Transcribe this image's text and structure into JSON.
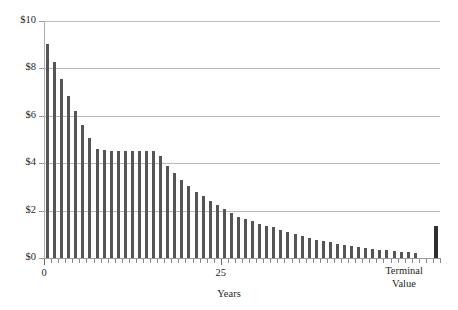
{
  "chart_data": {
    "type": "bar",
    "title": "",
    "subtitle": "",
    "xlabel": "Years",
    "ylabel": "",
    "ylim": [
      0,
      10
    ],
    "xlim": [
      0,
      54
    ],
    "grid": true,
    "legend": null,
    "y_tick_labels": [
      "$10",
      "$8",
      "$6",
      "$4",
      "$2",
      "$0"
    ],
    "y_tick_values": [
      10,
      8,
      6,
      4,
      2,
      0
    ],
    "x_tick_labels": [
      "0",
      "25"
    ],
    "x_tick_values": [
      0,
      25
    ],
    "annotations": [
      "Terminal Value"
    ],
    "terminal_value_label_lines": [
      "Terminal",
      "Value"
    ],
    "bar_color": "#555555",
    "terminal_bar_color": "#2f2f2f",
    "gridline_color": "#b9b9b9",
    "axis_color": "#9a9a9a",
    "categories": [
      1,
      2,
      3,
      4,
      5,
      6,
      7,
      8,
      9,
      10,
      11,
      12,
      13,
      14,
      15,
      16,
      17,
      18,
      19,
      20,
      21,
      22,
      23,
      24,
      25,
      26,
      27,
      28,
      29,
      30,
      31,
      32,
      33,
      34,
      35,
      36,
      37,
      38,
      39,
      40,
      41,
      42,
      43,
      44,
      45,
      46,
      47,
      48,
      49,
      50,
      51,
      52,
      53
    ],
    "values": [
      9.05,
      8.25,
      7.55,
      6.85,
      6.2,
      5.6,
      5.05,
      4.6,
      4.55,
      4.5,
      4.5,
      4.5,
      4.5,
      4.5,
      4.5,
      4.5,
      4.3,
      3.9,
      3.6,
      3.3,
      3.05,
      2.8,
      2.6,
      2.4,
      2.25,
      2.05,
      1.9,
      1.75,
      1.65,
      1.55,
      1.45,
      1.35,
      1.3,
      1.2,
      1.1,
      1.0,
      0.92,
      0.85,
      0.78,
      0.72,
      0.66,
      0.6,
      0.55,
      0.5,
      0.46,
      0.42,
      0.38,
      0.35,
      0.32,
      0.29,
      0.26,
      0.24,
      0.22
    ],
    "terminal_value": 1.35,
    "terminal_value_index": 55
  }
}
